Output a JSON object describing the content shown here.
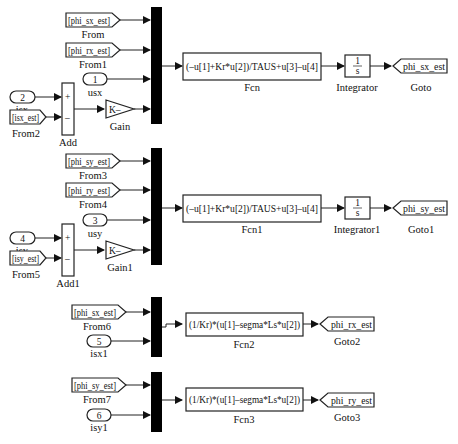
{
  "diagram": {
    "type": "simulink-block-diagram",
    "subsystems": [
      {
        "id": "flux_sx",
        "from_blocks": [
          {
            "name": "From",
            "tag": "[phi_sx_est]"
          },
          {
            "name": "From1",
            "tag": "[phi_rx_est]"
          },
          {
            "name": "From2",
            "tag": "[isx_est]"
          }
        ],
        "inports": [
          {
            "name": "usx",
            "number": "1"
          },
          {
            "name": "isx",
            "number": "2"
          }
        ],
        "add": {
          "name": "Add",
          "signs": [
            "+",
            "–"
          ]
        },
        "gain": {
          "name": "Gain",
          "value": "K–"
        },
        "fcn": {
          "name": "Fcn",
          "expr": "(–u[1]+Kr*u[2])/TAUS+u[3]–u[4]"
        },
        "integrator": {
          "name": "Integrator",
          "num": "1",
          "den": "s"
        },
        "goto": {
          "name": "Goto",
          "tag": "phi_sx_est"
        }
      },
      {
        "id": "flux_sy",
        "from_blocks": [
          {
            "name": "From3",
            "tag": "[phi_sy_est]"
          },
          {
            "name": "From4",
            "tag": "[phi_ry_est]"
          },
          {
            "name": "From5",
            "tag": "[isy_est]"
          }
        ],
        "inports": [
          {
            "name": "usy",
            "number": "3"
          },
          {
            "name": "isy",
            "number": "4"
          }
        ],
        "add": {
          "name": "Add1",
          "signs": [
            "+",
            "–"
          ]
        },
        "gain": {
          "name": "Gain1",
          "value": "K–"
        },
        "fcn": {
          "name": "Fcn1",
          "expr": "(–u[1]+Kr*u[2])/TAUS+u[3]–u[4]"
        },
        "integrator": {
          "name": "Integrator1",
          "num": "1",
          "den": "s"
        },
        "goto": {
          "name": "Goto1",
          "tag": "phi_sy_est"
        }
      },
      {
        "id": "flux_rx",
        "from_blocks": [
          {
            "name": "From6",
            "tag": "[phi_sx_est]"
          }
        ],
        "inports": [
          {
            "name": "isx1",
            "number": "5"
          }
        ],
        "fcn": {
          "name": "Fcn2",
          "expr": "(1/Kr)*(u[1]–segma*Ls*u[2])"
        },
        "goto": {
          "name": "Goto2",
          "tag": "phi_rx_est"
        }
      },
      {
        "id": "flux_ry",
        "from_blocks": [
          {
            "name": "From7",
            "tag": "[phi_sy_est]"
          }
        ],
        "inports": [
          {
            "name": "isy1",
            "number": "6"
          }
        ],
        "fcn": {
          "name": "Fcn3",
          "expr": "(1/Kr)*(u[1]–segma*Ls*u[2])"
        },
        "goto": {
          "name": "Goto3",
          "tag": "phi_ry_est"
        }
      }
    ]
  }
}
